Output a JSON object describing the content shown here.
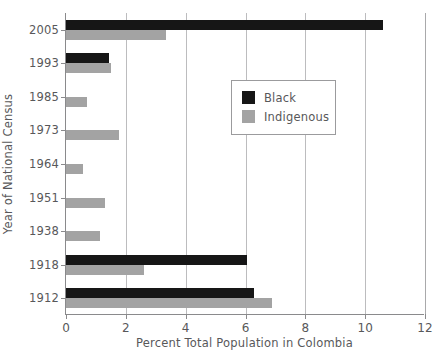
{
  "chart_data": {
    "type": "bar",
    "orientation": "horizontal",
    "title": "",
    "xlabel": "Percent Total Population in Colombia",
    "ylabel": "Year of National Census",
    "categories": [
      "2005",
      "1993",
      "1985",
      "1973",
      "1964",
      "1951",
      "1938",
      "1918",
      "1912"
    ],
    "series": [
      {
        "name": "Black",
        "color": "#161616",
        "values": [
          10.6,
          1.45,
          0,
          0,
          0,
          0,
          0,
          6.05,
          6.3
        ]
      },
      {
        "name": "Indigenous",
        "color": "#a3a3a3",
        "values": [
          3.35,
          1.5,
          0.7,
          1.77,
          0.57,
          1.32,
          1.15,
          2.6,
          6.9
        ]
      }
    ],
    "xlim": [
      0,
      12
    ],
    "xticks": [
      0,
      2,
      4,
      6,
      8,
      10,
      12
    ],
    "xticklabels": [
      "0",
      "2",
      "4",
      "6",
      "8",
      "10",
      "12"
    ],
    "grid": "vertical",
    "legend_position": "center-right",
    "legend_entries": [
      "Black",
      "Indigenous"
    ]
  },
  "axes": {
    "x_title": "Percent Total Population in Colombia",
    "y_title": "Year of National Census"
  },
  "colors": {
    "black_series": "#161616",
    "indigenous_series": "#a3a3a3",
    "axis": "#8a8a8c",
    "grid": "#bcbcbe",
    "text": "#58585a",
    "background": "#ffffff"
  }
}
